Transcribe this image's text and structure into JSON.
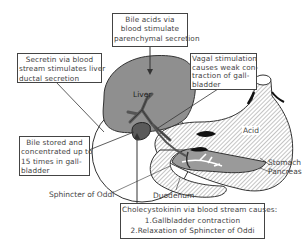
{
  "diagram": {
    "type": "anatomical-physiology-diagram",
    "callouts": {
      "bile_acids": {
        "lines": [
          "Bile acids via",
          "blood stimulate",
          "parenchymal secretion"
        ]
      },
      "secretin": {
        "lines": [
          "Secretin via blood",
          "stream stimulates liver",
          "ductal secretion"
        ]
      },
      "vagal": {
        "lines": [
          "Vagal stimulation",
          "causes weak con-",
          "traction of gall-",
          "bladder"
        ]
      },
      "bile_stored": {
        "lines": [
          "Bile stored and",
          "concentrated up to",
          "15 times in gall-",
          "bladder"
        ]
      },
      "cholecystokinin": {
        "lines": [
          "Cholecystokinin via blood stream causes:",
          "1.Gallbladder contraction",
          "2.Relaxation of Sphincter of Oddi"
        ]
      }
    },
    "labels": {
      "liver": "Liver",
      "acid": "Acid",
      "stomach": "Stomach",
      "pancreas": "Pancreas",
      "duodenum": "Duodenum",
      "sphincter": "Sphincter of Oddi"
    },
    "colors": {
      "liver_fill": "#8f8f8f",
      "gallbladder_fill": "#5a5a5a",
      "hatch": "#7a7a7a",
      "outline": "#333333",
      "box_border": "#444444"
    }
  }
}
